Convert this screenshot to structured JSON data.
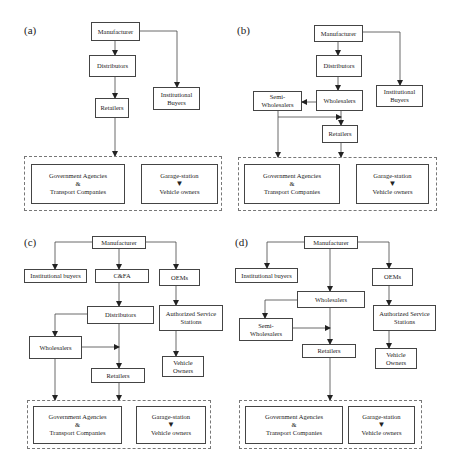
{
  "panels": {
    "a": {
      "label": "(a)",
      "manufacturer": "Manufacturer",
      "distributors": "Distributors",
      "retailers": "Retailers",
      "institutional_line1": "Institutional",
      "institutional_line2": "Buyers",
      "gov_line1": "Government Agencies",
      "gov_amp": "&",
      "gov_line2": "Transport Companies",
      "garage": "Garage-station",
      "vehicle_owners": "Vehicle owners"
    },
    "b": {
      "label": "(b)",
      "manufacturer": "Manufacturer",
      "distributors": "Distributors",
      "wholesalers": "Wholesalers",
      "semi_line1": "Semi-",
      "semi_line2": "Wholesalers",
      "retailers": "Retailers",
      "institutional_line1": "Institutional",
      "institutional_line2": "Buyers",
      "gov_line1": "Government Agencies",
      "gov_amp": "&",
      "gov_line2": "Transport Companies",
      "garage": "Garage-station",
      "vehicle_owners": "Vehicle owners"
    },
    "c": {
      "label": "(c)",
      "manufacturer": "Manufacturer",
      "institutional": "Institutional buyers",
      "cfa": "C&FA",
      "oems": "OEMs",
      "distributors": "Distributors",
      "authorized_line1": "Authorized Service",
      "authorized_line2": "Stations",
      "wholesalers": "Wholesalers",
      "retailers": "Retailers",
      "vehicle_line1": "Vehicle",
      "vehicle_line2": "Owners",
      "gov_line1": "Government Agencies",
      "gov_amp": "&",
      "gov_line2": "Transport Companies",
      "garage": "Garage-station",
      "vehicle_owners": "Vehicle owners"
    },
    "d": {
      "label": "(d)",
      "manufacturer": "Manufacturer",
      "institutional": "Institutional buyers",
      "oems": "OEMs",
      "wholesalers": "Wholesalers",
      "semi_line1": "Semi-",
      "semi_line2": "Wholesalers",
      "retailers": "Retailers",
      "authorized_line1": "Authorized Service",
      "authorized_line2": "Stations",
      "vehicle_line1": "Vehicle",
      "vehicle_line2": "Owners",
      "gov_line1": "Government Agencies",
      "gov_amp": "&",
      "gov_line2": "Transport Companies",
      "garage": "Garage-station",
      "vehicle_owners": "Vehicle owners"
    }
  }
}
